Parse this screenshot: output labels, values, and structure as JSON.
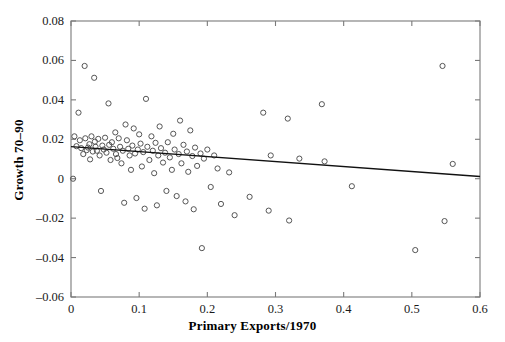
{
  "chart_data": {
    "type": "scatter",
    "title": "",
    "xlabel": "Primary Exports/1970",
    "ylabel": "Growth 70–90",
    "xlim": [
      0,
      0.6
    ],
    "ylim": [
      -0.06,
      0.08
    ],
    "xticks": [
      0,
      0.1,
      0.2,
      0.3,
      0.4,
      0.5,
      0.6
    ],
    "xticklabels": [
      "0",
      "0.1",
      "0.2",
      "0.3",
      "0.4",
      "0.5",
      "0.6"
    ],
    "yticks": [
      -0.06,
      -0.04,
      -0.02,
      0,
      0.02,
      0.04,
      0.06,
      0.08
    ],
    "yticklabels": [
      "–0.06",
      "–0.04",
      "–0.02",
      "0",
      "0.02",
      "0.04",
      "0.06",
      "0.08"
    ],
    "grid": false,
    "legend": null,
    "marker": "open-circle",
    "marker_color": "#555555",
    "line_color": "#000000",
    "points": [
      [
        0.003,
        0.0
      ],
      [
        0.005,
        0.0215
      ],
      [
        0.008,
        0.0165
      ],
      [
        0.011,
        0.0335
      ],
      [
        0.013,
        0.0195
      ],
      [
        0.015,
        0.0155
      ],
      [
        0.018,
        0.0125
      ],
      [
        0.02,
        0.0572
      ],
      [
        0.021,
        0.0205
      ],
      [
        0.023,
        0.0145
      ],
      [
        0.025,
        0.0158
      ],
      [
        0.027,
        0.0175
      ],
      [
        0.028,
        0.0098
      ],
      [
        0.03,
        0.0215
      ],
      [
        0.032,
        0.0138
      ],
      [
        0.034,
        0.0512
      ],
      [
        0.035,
        0.0188
      ],
      [
        0.036,
        0.0162
      ],
      [
        0.038,
        0.0142
      ],
      [
        0.04,
        0.0202
      ],
      [
        0.042,
        0.0118
      ],
      [
        0.044,
        -0.0062
      ],
      [
        0.046,
        0.0168
      ],
      [
        0.048,
        0.0148
      ],
      [
        0.05,
        0.0208
      ],
      [
        0.052,
        0.0132
      ],
      [
        0.055,
        0.0382
      ],
      [
        0.056,
        0.0172
      ],
      [
        0.058,
        0.0095
      ],
      [
        0.06,
        0.0185
      ],
      [
        0.062,
        0.0152
      ],
      [
        0.065,
        0.0235
      ],
      [
        0.066,
        0.0125
      ],
      [
        0.068,
        0.0105
      ],
      [
        0.07,
        0.0205
      ],
      [
        0.072,
        0.0162
      ],
      [
        0.074,
        0.0078
      ],
      [
        0.076,
        0.0142
      ],
      [
        0.078,
        -0.0122
      ],
      [
        0.08,
        0.0275
      ],
      [
        0.082,
        0.0195
      ],
      [
        0.084,
        0.0152
      ],
      [
        0.086,
        0.0118
      ],
      [
        0.088,
        0.0045
      ],
      [
        0.09,
        0.0168
      ],
      [
        0.092,
        0.0255
      ],
      [
        0.094,
        0.0128
      ],
      [
        0.096,
        -0.0098
      ],
      [
        0.098,
        0.0148
      ],
      [
        0.1,
        0.0225
      ],
      [
        0.102,
        0.0178
      ],
      [
        0.104,
        0.0062
      ],
      [
        0.106,
        0.0135
      ],
      [
        0.108,
        -0.0152
      ],
      [
        0.11,
        0.0405
      ],
      [
        0.112,
        0.0162
      ],
      [
        0.115,
        0.0095
      ],
      [
        0.118,
        0.0215
      ],
      [
        0.12,
        0.0142
      ],
      [
        0.122,
        0.0028
      ],
      [
        0.124,
        0.0182
      ],
      [
        0.126,
        -0.0135
      ],
      [
        0.128,
        0.0118
      ],
      [
        0.13,
        0.0265
      ],
      [
        0.132,
        0.0155
      ],
      [
        0.135,
        0.0082
      ],
      [
        0.138,
        0.0132
      ],
      [
        0.14,
        -0.0062
      ],
      [
        0.142,
        0.0185
      ],
      [
        0.145,
        0.0108
      ],
      [
        0.148,
        0.0045
      ],
      [
        0.15,
        0.0228
      ],
      [
        0.152,
        0.0148
      ],
      [
        0.155,
        -0.0088
      ],
      [
        0.158,
        0.0125
      ],
      [
        0.16,
        0.0295
      ],
      [
        0.162,
        0.0078
      ],
      [
        0.165,
        0.0172
      ],
      [
        0.168,
        -0.0115
      ],
      [
        0.17,
        0.0138
      ],
      [
        0.172,
        0.0035
      ],
      [
        0.175,
        0.0245
      ],
      [
        0.178,
        0.0115
      ],
      [
        0.18,
        -0.0155
      ],
      [
        0.182,
        0.0158
      ],
      [
        0.185,
        0.0065
      ],
      [
        0.19,
        0.0128
      ],
      [
        0.192,
        -0.0352
      ],
      [
        0.195,
        0.0102
      ],
      [
        0.2,
        0.0148
      ],
      [
        0.205,
        -0.0042
      ],
      [
        0.21,
        0.0118
      ],
      [
        0.215,
        0.0052
      ],
      [
        0.22,
        -0.0128
      ],
      [
        0.232,
        0.0032
      ],
      [
        0.24,
        -0.0185
      ],
      [
        0.262,
        -0.0092
      ],
      [
        0.282,
        0.0335
      ],
      [
        0.29,
        -0.0162
      ],
      [
        0.293,
        0.0118
      ],
      [
        0.318,
        0.0305
      ],
      [
        0.32,
        -0.0212
      ],
      [
        0.335,
        0.0102
      ],
      [
        0.368,
        0.0378
      ],
      [
        0.372,
        0.0088
      ],
      [
        0.412,
        -0.0038
      ],
      [
        0.505,
        -0.0362
      ],
      [
        0.545,
        0.0572
      ],
      [
        0.548,
        -0.0215
      ],
      [
        0.56,
        0.0075
      ]
    ],
    "fit_line": {
      "x_start": 0.0,
      "y_start": 0.0163,
      "x_end": 0.6,
      "y_end": 0.0011
    },
    "n_points": 111
  },
  "ticks": {
    "y": [
      {
        "value": 0.08,
        "label": "0.08",
        "px": 21
      },
      {
        "value": 0.06,
        "label": "0.06",
        "px": 60.4
      },
      {
        "value": 0.04,
        "label": "0.04",
        "px": 99.9
      },
      {
        "value": 0.02,
        "label": "0.02",
        "px": 139.3
      },
      {
        "value": 0,
        "label": "0",
        "px": 178.7
      },
      {
        "value": -0.02,
        "label": "–0.02",
        "px": 218.1
      },
      {
        "value": -0.04,
        "label": "–0.04",
        "px": 257.6
      },
      {
        "value": -0.06,
        "label": "–0.06",
        "px": 297
      }
    ],
    "x": [
      {
        "value": 0,
        "label": "0",
        "px": 71
      },
      {
        "value": 0.1,
        "label": "0.1",
        "px": 139.2
      },
      {
        "value": 0.2,
        "label": "0.2",
        "px": 207.3
      },
      {
        "value": 0.3,
        "label": "0.3",
        "px": 275.5
      },
      {
        "value": 0.4,
        "label": "0.4",
        "px": 343.7
      },
      {
        "value": 0.5,
        "label": "0.5",
        "px": 411.8
      },
      {
        "value": 0.6,
        "label": "0.6",
        "px": 480
      }
    ]
  },
  "colors": {
    "axis": "#7a7a7a",
    "marker": "#555555",
    "line": "#111111",
    "text": "#111111",
    "background": "#ffffff"
  }
}
